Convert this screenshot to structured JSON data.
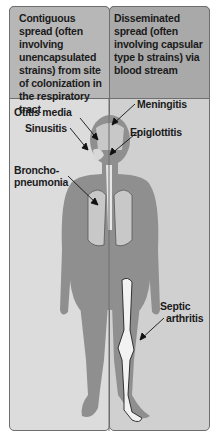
{
  "headers": {
    "left": "Contiguous spread (often involving unencapsulated strains) from site of colonization in the respiratory tract",
    "right": "Disseminated spread (often involving capsular type b strains) via blood stream"
  },
  "labels": {
    "otitis_media": "Otitis media",
    "sinusitis": "Sinusitis",
    "bronchopneumonia_1": "Broncho-",
    "bronchopneumonia_2": "pneumonia",
    "meningitis": "Meningitis",
    "epiglottitis": "Epiglottitis",
    "septic_arthritis_1": "Septic",
    "septic_arthritis_2": "arthritis"
  },
  "colors": {
    "header_left": "#b7b7b7",
    "header_right": "#a9a9a9",
    "panel_left": "#dcdcdc",
    "panel_right": "#d0d0d0",
    "body_silhouette": "#8f8f8f",
    "bone": "#f2f2f2"
  }
}
